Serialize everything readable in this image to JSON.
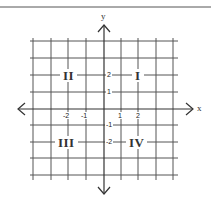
{
  "diagram": {
    "type": "coordinate-plane",
    "colors": {
      "grid": "#444444",
      "axis": "#333333",
      "background": "#ffffff",
      "rule": "#555555"
    },
    "axes": {
      "x_label": "x",
      "y_label": "y"
    },
    "x_ticks": [
      {
        "value": -2,
        "label": "-2"
      },
      {
        "value": -1,
        "label": "-1"
      },
      {
        "value": 1,
        "label": "1"
      },
      {
        "value": 2,
        "label": "2"
      }
    ],
    "y_ticks": [
      {
        "value": 2,
        "label": "2"
      },
      {
        "value": 1,
        "label": "1"
      },
      {
        "value": -1,
        "label": "-1"
      },
      {
        "value": -2,
        "label": "-2"
      }
    ],
    "quadrants": {
      "q1": "I",
      "q2": "II",
      "q3": "III",
      "q4": "IV"
    },
    "grid_range": {
      "x": [
        -4,
        4
      ],
      "y": [
        -4,
        4
      ]
    }
  }
}
